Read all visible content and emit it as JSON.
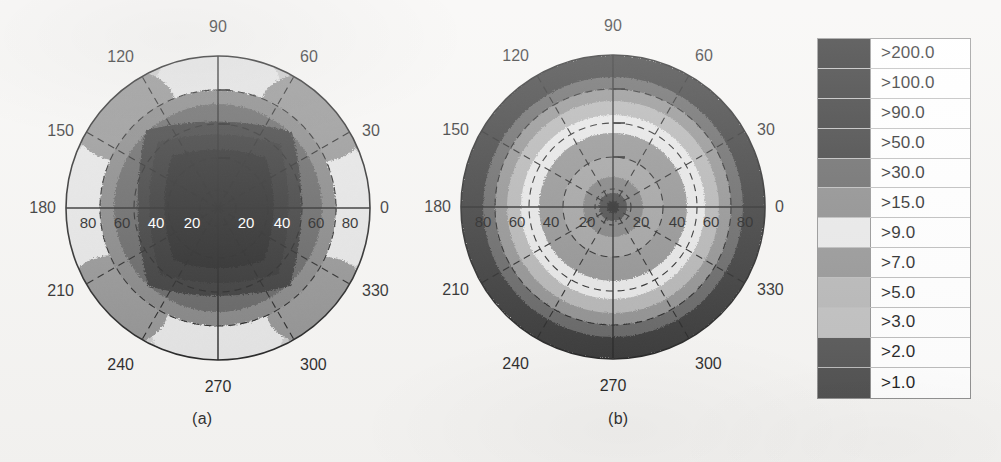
{
  "figure": {
    "background_color": "#f6f5f3",
    "panels": [
      {
        "id": "a",
        "caption": "(a)",
        "center": {
          "x": 218,
          "y": 208
        },
        "outer_radius": 152,
        "description": "Polar contour plot with a large dark high-value core and azimuthally varying lighter lobes near the rim"
      },
      {
        "id": "b",
        "caption": "(b)",
        "center": {
          "x": 613,
          "y": 207
        },
        "outer_radius": 152,
        "description": "Polar contour plot with concentric, nearly axisymmetric rings decreasing outward then darkening at the rim"
      }
    ],
    "azimuth_labels": [
      "0",
      "30",
      "60",
      "90",
      "120",
      "150",
      "180",
      "210",
      "240",
      "270",
      "300",
      "330"
    ],
    "azimuth_step_deg": 30,
    "radial_tick_labels": [
      "80",
      "60",
      "40",
      "20",
      "20",
      "40",
      "60",
      "80"
    ],
    "radial_rings": [
      20,
      40,
      60,
      80
    ],
    "radial_max": 90
  },
  "legend": {
    "title": "",
    "border_color": "#8d8d8d",
    "entries": [
      {
        "label": ">200.0",
        "value": 200.0,
        "color": "#1c1c1c"
      },
      {
        "label": ">100.0",
        "value": 100.0,
        "color": "#232323"
      },
      {
        "label": ">90.0",
        "value": 90.0,
        "color": "#272727"
      },
      {
        "label": ">50.0",
        "value": 50.0,
        "color": "#2e2e2e"
      },
      {
        "label": ">30.0",
        "value": 30.0,
        "color": "#5d5d5d"
      },
      {
        "label": ">15.0",
        "value": 15.0,
        "color": "#848484"
      },
      {
        "label": ">9.0",
        "value": 9.0,
        "color": "#e7e7e7"
      },
      {
        "label": ">7.0",
        "value": 7.0,
        "color": "#8f8f8f"
      },
      {
        "label": ">5.0",
        "value": 5.0,
        "color": "#b3b3b3"
      },
      {
        "label": ">3.0",
        "value": 3.0,
        "color": "#bcbcbc"
      },
      {
        "label": ">2.0",
        "value": 2.0,
        "color": "#4f4f4f"
      },
      {
        "label": ">1.0",
        "value": 1.0,
        "color": "#4a4a4a"
      }
    ]
  },
  "chart_data": {
    "type": "heatmap",
    "subtype": "polar-contour",
    "title": "",
    "xlabel": "",
    "ylabel": "",
    "legend_position": "right",
    "grid": true,
    "angular_axis": {
      "label": "azimuth (deg)",
      "ticks": [
        0,
        30,
        60,
        90,
        120,
        150,
        180,
        210,
        240,
        270,
        300,
        330
      ],
      "tick_labels": [
        "0",
        "30",
        "60",
        "90",
        "120",
        "150",
        "180",
        "210",
        "240",
        "270",
        "300",
        "330"
      ]
    },
    "radial_axis": {
      "label": "zenith angle (deg)",
      "range": [
        0,
        90
      ],
      "ticks": [
        20,
        40,
        60,
        80
      ],
      "tick_labels_left": [
        "80",
        "60",
        "40",
        "20"
      ],
      "tick_labels_right": [
        "20",
        "40",
        "60",
        "80"
      ]
    },
    "contour_levels": [
      1.0,
      2.0,
      3.0,
      5.0,
      7.0,
      9.0,
      15.0,
      30.0,
      50.0,
      90.0,
      100.0,
      200.0
    ],
    "level_colors": [
      "#4a4a4a",
      "#4f4f4f",
      "#bcbcbc",
      "#b3b3b3",
      "#8f8f8f",
      "#e7e7e7",
      "#848484",
      "#5d5d5d",
      "#2e2e2e",
      "#272727",
      "#232323",
      "#1c1c1c"
    ],
    "panels": [
      {
        "name": "(a)",
        "comment": "value (level index) sampled on a polar grid: rows = radius 0..90 step 10, cols = azimuth 0..330 step 30",
        "radii": [
          0,
          10,
          20,
          30,
          40,
          50,
          60,
          70,
          80,
          90
        ],
        "azimuths": [
          0,
          30,
          60,
          90,
          120,
          150,
          180,
          210,
          240,
          270,
          300,
          330
        ],
        "values": [
          [
            200,
            200,
            200,
            200,
            200,
            200,
            200,
            200,
            200,
            200,
            200,
            200
          ],
          [
            200,
            200,
            200,
            200,
            200,
            200,
            200,
            200,
            200,
            200,
            200,
            200
          ],
          [
            200,
            200,
            200,
            200,
            200,
            200,
            200,
            200,
            200,
            200,
            200,
            200
          ],
          [
            100,
            200,
            100,
            200,
            100,
            200,
            100,
            200,
            100,
            200,
            100,
            200
          ],
          [
            90,
            100,
            50,
            90,
            50,
            100,
            90,
            100,
            50,
            90,
            50,
            100
          ],
          [
            30,
            50,
            15,
            30,
            15,
            50,
            30,
            50,
            15,
            30,
            15,
            50
          ],
          [
            15,
            30,
            9,
            15,
            9,
            30,
            15,
            30,
            9,
            15,
            9,
            30
          ],
          [
            9,
            15,
            7,
            9,
            7,
            15,
            9,
            15,
            7,
            9,
            7,
            15
          ],
          [
            15,
            9,
            15,
            7,
            15,
            9,
            15,
            9,
            15,
            7,
            15,
            9
          ],
          [
            9,
            15,
            9,
            15,
            9,
            15,
            9,
            15,
            9,
            15,
            9,
            15
          ]
        ]
      },
      {
        "name": "(b)",
        "comment": "nearly axisymmetric: value depends mainly on radius",
        "radii": [
          0,
          10,
          20,
          30,
          40,
          50,
          60,
          70,
          80,
          90
        ],
        "azimuths": [
          0,
          30,
          60,
          90,
          120,
          150,
          180,
          210,
          240,
          270,
          300,
          330
        ],
        "values_by_radius": [
          200,
          90,
          50,
          30,
          15,
          9,
          15,
          30,
          50,
          90
        ]
      }
    ]
  }
}
